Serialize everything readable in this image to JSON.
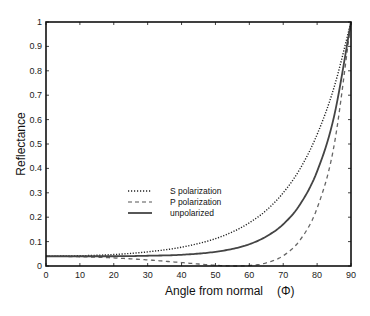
{
  "chart_data": {
    "type": "line",
    "title": "",
    "xlabel": "Angle from normal",
    "xlabel_symbol": "(Φ)",
    "ylabel": "Reflectance",
    "xlim": [
      0,
      90
    ],
    "ylim": [
      0,
      1
    ],
    "grid": false,
    "legend_position": "center-left inside plot",
    "x_ticks": [
      0,
      10,
      20,
      30,
      40,
      50,
      60,
      70,
      80,
      90
    ],
    "y_ticks": [
      0,
      0.1,
      0.2,
      0.3,
      0.4,
      0.5,
      0.6,
      0.7,
      0.8,
      0.9,
      1
    ],
    "y_tick_labels": [
      "0",
      "0.1",
      "0.2",
      "0.3",
      "0.4",
      "0.5",
      "0.6",
      "0.7",
      "0.8",
      "0.9",
      "1"
    ],
    "x": [
      0,
      10,
      20,
      30,
      40,
      50,
      56.3,
      60,
      65,
      70,
      75,
      80,
      85,
      90
    ],
    "series": [
      {
        "name": "S polarization",
        "style": "dotted",
        "values": [
          0.04,
          0.042,
          0.047,
          0.058,
          0.077,
          0.112,
          0.148,
          0.177,
          0.228,
          0.3,
          0.399,
          0.539,
          0.732,
          1.0
        ]
      },
      {
        "name": "P polarization",
        "style": "dashed",
        "values": [
          0.04,
          0.038,
          0.033,
          0.025,
          0.014,
          0.003,
          0.0,
          0.002,
          0.013,
          0.042,
          0.107,
          0.237,
          0.493,
          1.0
        ]
      },
      {
        "name": "unpolarized",
        "style": "solid",
        "values": [
          0.04,
          0.04,
          0.04,
          0.042,
          0.046,
          0.058,
          0.074,
          0.089,
          0.121,
          0.171,
          0.253,
          0.388,
          0.613,
          1.0
        ]
      }
    ]
  }
}
